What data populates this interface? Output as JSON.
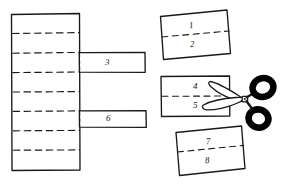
{
  "figure": {
    "type": "line-drawing",
    "ink_color": "#1a1a1a",
    "paper_color": "#ffffff",
    "scissors_ring_color": "#000000"
  },
  "strip": {
    "name": "folded-strip",
    "segment_count": 8,
    "fold_line_count": 7,
    "fold_line_style": "dashed"
  },
  "tabs": [
    {
      "id": "tab-3",
      "label": "3"
    },
    {
      "id": "tab-6",
      "label": "6"
    }
  ],
  "pieces": [
    {
      "id": "piece-top",
      "rotation_deg": -6,
      "top_label": "1",
      "bottom_label": "2",
      "divider_style": "dashed"
    },
    {
      "id": "piece-middle",
      "rotation_deg": 0,
      "top_label": "4",
      "bottom_label": "5",
      "divider_style": "dashed"
    },
    {
      "id": "piece-bottom",
      "rotation_deg": 6,
      "top_label": "7",
      "bottom_label": "8",
      "divider_style": "dashed"
    }
  ],
  "scissors": {
    "name": "scissors",
    "blade_direction": "left",
    "handle_rings": 2,
    "overlaps_piece": "piece-middle"
  }
}
